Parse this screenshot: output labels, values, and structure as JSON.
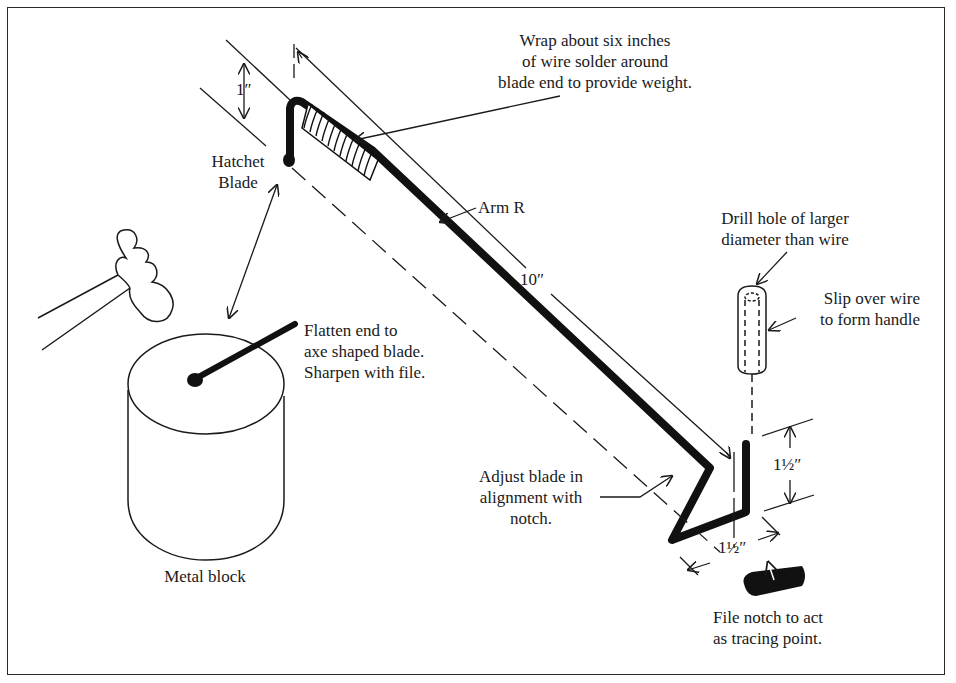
{
  "diagram": {
    "type": "instructional-assembly-diagram",
    "labels": {
      "wrap_note": [
        "Wrap about six inches",
        "of wire solder around",
        "blade end to provide weight."
      ],
      "hatchet_blade": [
        "Hatchet",
        "Blade"
      ],
      "arm_r": "Arm R",
      "flatten_note": [
        "Flatten end to",
        "axe shaped blade.",
        "Sharpen with file."
      ],
      "metal_block": "Metal block",
      "drill_note": [
        "Drill hole of larger",
        "diameter than wire"
      ],
      "slip_note": [
        "Slip over wire",
        "to form handle"
      ],
      "adjust_note": [
        "Adjust blade in",
        "alignment with",
        "notch."
      ],
      "file_note": [
        "File notch to act",
        "as tracing point."
      ]
    },
    "dimensions": {
      "blade_height": "1″",
      "arm_length": "10″",
      "tracer_height": "1½″",
      "tracer_offset": "1½″"
    },
    "colors": {
      "ink": "#1a1a1a",
      "paper": "#ffffff"
    }
  }
}
